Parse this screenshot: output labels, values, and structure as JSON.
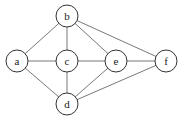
{
  "graph": {
    "nodes": [
      {
        "id": "a",
        "label": "a",
        "x": 17,
        "y": 61
      },
      {
        "id": "b",
        "label": "b",
        "x": 67,
        "y": 16
      },
      {
        "id": "c",
        "label": "c",
        "x": 67,
        "y": 61
      },
      {
        "id": "d",
        "label": "d",
        "x": 67,
        "y": 104
      },
      {
        "id": "e",
        "label": "e",
        "x": 116,
        "y": 61
      },
      {
        "id": "f",
        "label": "f",
        "x": 166,
        "y": 61
      }
    ],
    "edges": [
      [
        "a",
        "b"
      ],
      [
        "a",
        "c"
      ],
      [
        "a",
        "d"
      ],
      [
        "b",
        "c"
      ],
      [
        "b",
        "e"
      ],
      [
        "b",
        "f"
      ],
      [
        "c",
        "e"
      ],
      [
        "c",
        "d"
      ],
      [
        "e",
        "f"
      ],
      [
        "e",
        "d"
      ],
      [
        "d",
        "f"
      ]
    ],
    "node_radius": 11
  }
}
